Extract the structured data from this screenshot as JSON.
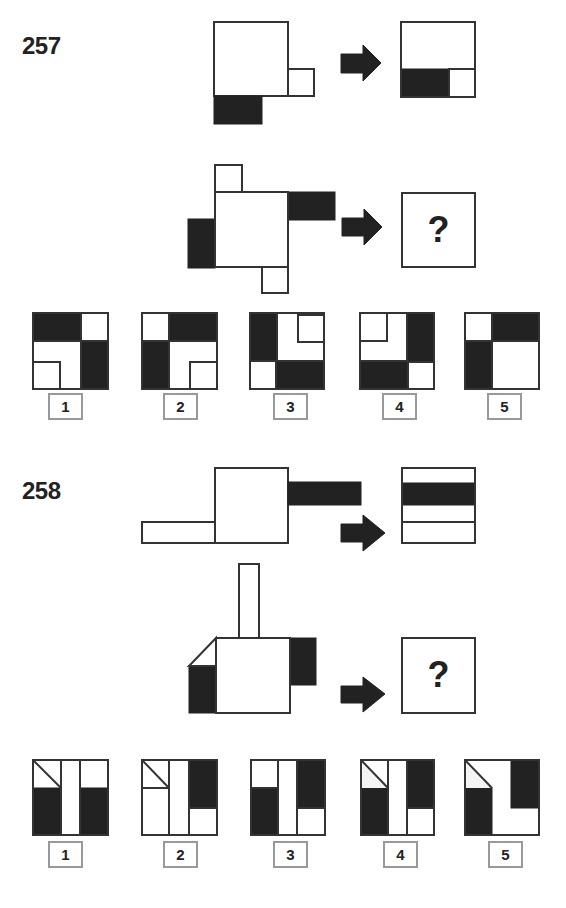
{
  "puzzles": [
    {
      "number": "257",
      "question_mark": "?",
      "options": [
        {
          "label": "1"
        },
        {
          "label": "2"
        },
        {
          "label": "3"
        },
        {
          "label": "4"
        },
        {
          "label": "5"
        }
      ]
    },
    {
      "number": "258",
      "question_mark": "?",
      "options": [
        {
          "label": "1"
        },
        {
          "label": "2"
        },
        {
          "label": "3"
        },
        {
          "label": "4"
        },
        {
          "label": "5"
        }
      ]
    }
  ],
  "colors": {
    "fill_dark": "#222222",
    "stroke": "#333333",
    "label_border": "#999999"
  },
  "icons": {
    "arrow": "right-arrow-icon"
  }
}
